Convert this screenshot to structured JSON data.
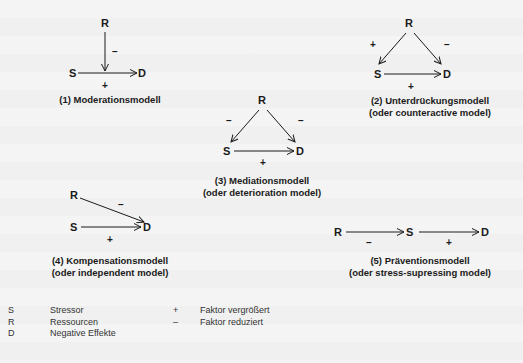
{
  "nodes": {
    "S": "S",
    "R": "R",
    "D": "D"
  },
  "signs": {
    "plus": "+",
    "minus": "–"
  },
  "models": [
    {
      "number": "(1)",
      "title": "(1) Moderationsmodell",
      "subtitle": ""
    },
    {
      "number": "(2)",
      "title": "(2) Unterdrückungsmodell",
      "subtitle": "(oder counteractive model)"
    },
    {
      "number": "(3)",
      "title": "(3) Mediationsmodell",
      "subtitle": "(oder deterioration model)"
    },
    {
      "number": "(4)",
      "title": "(4) Kompensationsmodell",
      "subtitle": "(oder independent model)"
    },
    {
      "number": "(5)",
      "title": "(5) Präventionsmodell",
      "subtitle": "(oder stress-supressing model)"
    }
  ],
  "legend": {
    "symbols": [
      {
        "key": "S",
        "label": "Stressor"
      },
      {
        "key": "R",
        "label": "Ressourcen"
      },
      {
        "key": "D",
        "label": "Negative Effekte"
      }
    ],
    "signs": [
      {
        "key": "+",
        "label": "Faktor vergrößert"
      },
      {
        "key": "–",
        "label": "Faktor reduziert"
      }
    ]
  }
}
